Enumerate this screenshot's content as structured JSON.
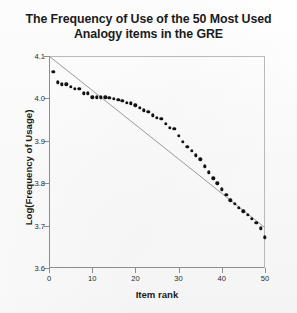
{
  "chart_data": {
    "type": "scatter",
    "title": "The Frequency of Use of the 50 Most Used Analogy items in the GRE",
    "title_line1": "The Frequency of Use of the 50 Most Used",
    "title_line2": "Analogy items in the GRE",
    "xlabel": "Item rank",
    "ylabel": "Log(Frequency of Usage)",
    "xlim": [
      0,
      50
    ],
    "ylim": [
      3.6,
      4.1
    ],
    "xticks": [
      0,
      10,
      20,
      30,
      40,
      50
    ],
    "xtick_labels": [
      "0",
      "10",
      "20",
      "30",
      "40",
      "50"
    ],
    "yticks": [
      3.6,
      3.7,
      3.8,
      3.9,
      4.0,
      4.1
    ],
    "ytick_labels": [
      "3.6",
      "3.7",
      "3.8",
      "3.9",
      "4.0",
      "4.1"
    ],
    "grid": false,
    "legend": null,
    "marker": "filled-circle",
    "marker_color": "#121212",
    "line_color": "#9a9a9a",
    "x": [
      1,
      2,
      3,
      4,
      5,
      6,
      7,
      8,
      9,
      10,
      11,
      12,
      13,
      14,
      15,
      16,
      17,
      18,
      19,
      20,
      21,
      22,
      23,
      24,
      25,
      26,
      27,
      28,
      29,
      30,
      31,
      32,
      33,
      34,
      35,
      36,
      37,
      38,
      39,
      40,
      41,
      42,
      43,
      44,
      45,
      46,
      47,
      48,
      49,
      50
    ],
    "y": [
      4.063,
      4.038,
      4.033,
      4.033,
      4.028,
      4.022,
      4.022,
      4.012,
      4.012,
      4.003,
      4.003,
      4.003,
      4.003,
      4.002,
      3.999,
      3.996,
      3.994,
      3.99,
      3.988,
      3.984,
      3.978,
      3.972,
      3.968,
      3.96,
      3.954,
      3.952,
      3.94,
      3.93,
      3.928,
      3.912,
      3.898,
      3.886,
      3.876,
      3.866,
      3.856,
      3.84,
      3.826,
      3.812,
      3.8,
      3.786,
      3.772,
      3.76,
      3.752,
      3.742,
      3.734,
      3.726,
      3.716,
      3.706,
      3.694,
      3.672
    ],
    "series": [
      {
        "name": "Observed log frequency",
        "values": [
          4.063,
          4.038,
          4.033,
          4.033,
          4.028,
          4.022,
          4.022,
          4.012,
          4.012,
          4.003,
          4.003,
          4.003,
          4.003,
          4.002,
          3.999,
          3.996,
          3.994,
          3.99,
          3.988,
          3.984,
          3.978,
          3.972,
          3.968,
          3.96,
          3.954,
          3.952,
          3.94,
          3.93,
          3.928,
          3.912,
          3.898,
          3.886,
          3.876,
          3.866,
          3.856,
          3.84,
          3.826,
          3.812,
          3.8,
          3.786,
          3.772,
          3.76,
          3.752,
          3.742,
          3.734,
          3.726,
          3.716,
          3.706,
          3.694,
          3.672
        ]
      }
    ],
    "trend_line": {
      "name": "fitted regression line",
      "x0": 0,
      "y0": 4.1,
      "x1": 50,
      "y1": 3.695
    }
  }
}
